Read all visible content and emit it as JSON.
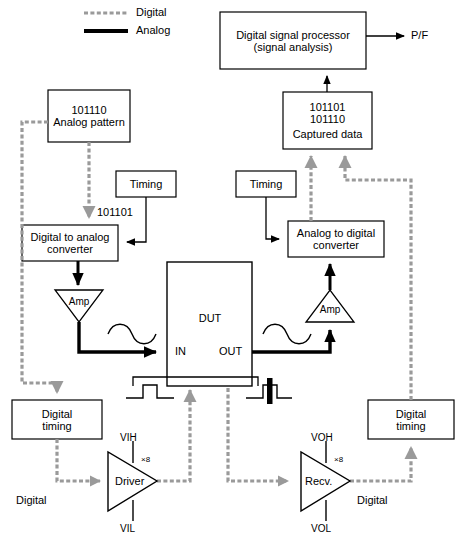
{
  "diagram": {
    "colors": {
      "digital": "#9a9a9a",
      "analog": "#000000",
      "box_stroke": "#000000",
      "background": "#ffffff"
    },
    "legend": {
      "items": [
        {
          "label": "Digital",
          "style": "dashed-gray",
          "color": "#9a9a9a"
        },
        {
          "label": "Analog",
          "style": "solid-thick-black",
          "color": "#000000"
        }
      ]
    },
    "boxes": {
      "analog_pattern": {
        "lines": [
          "101110",
          "Analog pattern"
        ]
      },
      "dsp": {
        "lines": [
          "Digital signal processor",
          "(signal analysis)"
        ]
      },
      "captured_data": {
        "lines": [
          "101101",
          "101110",
          "",
          "Captured data"
        ]
      },
      "timing_left": {
        "lines": [
          "Timing"
        ]
      },
      "timing_right": {
        "lines": [
          "Timing"
        ]
      },
      "dac": {
        "lines": [
          "Digital to analog",
          "converter"
        ]
      },
      "adc": {
        "lines": [
          "Analog to digital",
          "converter"
        ]
      },
      "dut": {
        "lines": [
          "DUT"
        ]
      },
      "digital_timing_left": {
        "lines": [
          "Digital",
          "timing"
        ]
      },
      "digital_timing_right": {
        "lines": [
          "Digital",
          "timing"
        ]
      }
    },
    "labels": {
      "dac_input_code": "101101",
      "dut_in": "IN",
      "dut_out": "OUT",
      "pass_fail": "P/F",
      "amp_left": "Amp",
      "amp_right": "Amp",
      "driver": "Driver",
      "receiver": "Recv.",
      "vih": "VIH",
      "vil": "VIL",
      "voh": "VOH",
      "vol": "VOL",
      "driver_multiplier": "×8",
      "receiver_multiplier": "×8",
      "digital_left": "Digital",
      "digital_right": "Digital"
    }
  }
}
